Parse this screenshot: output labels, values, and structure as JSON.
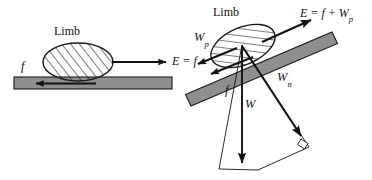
{
  "figure": {
    "title": "",
    "panels": [
      {
        "id": "horizontal-surface",
        "surface": "horizontal",
        "limb_label": "Limb",
        "labels": {
          "friction": "f",
          "effort": "E = f"
        },
        "vectors": [
          {
            "name": "friction",
            "symbol": "f",
            "direction": "left",
            "along": "surface"
          },
          {
            "name": "effort",
            "symbol": "E",
            "direction": "right",
            "along": "surface"
          }
        ]
      },
      {
        "id": "inclined-surface",
        "surface": "inclined",
        "limb_label": "Limb",
        "labels": {
          "effort": "E = f + W",
          "effort_sub": "p",
          "weight_parallel": "W",
          "weight_parallel_sub": "p",
          "friction": "f",
          "weight": "W",
          "weight_normal": "W",
          "weight_normal_sub": "n"
        },
        "vectors": [
          {
            "name": "effort",
            "symbol": "E",
            "direction": "up-slope"
          },
          {
            "name": "weight-parallel",
            "symbol": "Wp",
            "direction": "down-slope"
          },
          {
            "name": "friction",
            "symbol": "f",
            "direction": "down-slope"
          },
          {
            "name": "weight",
            "symbol": "W",
            "direction": "down"
          },
          {
            "name": "weight-normal",
            "symbol": "Wn",
            "direction": "normal-to-surface"
          }
        ],
        "right_angle_marker": true
      }
    ],
    "colors": {
      "surface_fill": "#8f8f8f",
      "surface_stroke": "#1a1a1a",
      "arrow": "#111111",
      "hatch": "#1a1a1a",
      "background": "#ffffff",
      "text": "#111111"
    }
  }
}
